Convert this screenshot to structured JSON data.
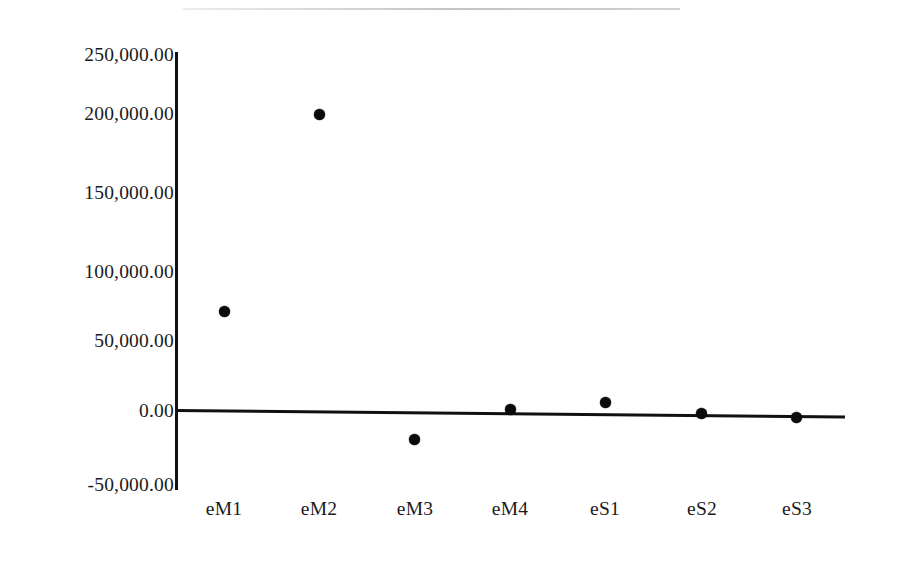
{
  "chart_data": {
    "type": "scatter",
    "title": "",
    "subtitle": "",
    "xlabel": "",
    "ylabel": "",
    "categories": [
      "eM1",
      "eM2",
      "eM3",
      "eM4",
      "eS1",
      "eS2",
      "eS3"
    ],
    "values": [
      70200.0,
      208500.0,
      -19700.0,
      1400.0,
      6300.0,
      -2100.0,
      -4900.0
    ],
    "series": [
      {
        "name": "",
        "values": [
          70200.0,
          208500.0,
          -19700.0,
          1400.0,
          6300.0,
          -2100.0,
          -4900.0
        ]
      }
    ],
    "ylim": [
      -50000,
      250000
    ],
    "ytick_values": [
      250000,
      200000,
      150000,
      100000,
      50000,
      0,
      -50000
    ],
    "ytick_labels": [
      "250,000.00",
      "200,000.00",
      "150,000.00",
      "100,000.00",
      "50,000.00",
      "0.00",
      "-50,000.00"
    ],
    "grid": false,
    "legend": false,
    "legend_position": "none",
    "marker_style": "filled-circle",
    "marker_color": "#0b0b0b",
    "axis_color": "#111111",
    "background_color": "#ffffff"
  },
  "axes": {
    "y": {
      "ticks": [
        {
          "label": "250,000.00",
          "value": 250000
        },
        {
          "label": "200,000.00",
          "value": 200000
        },
        {
          "label": "150,000.00",
          "value": 150000
        },
        {
          "label": "100,000.00",
          "value": 100000
        },
        {
          "label": "50,000.00",
          "value": 50000
        },
        {
          "label": "0.00",
          "value": 0
        },
        {
          "label": "-50,000.00",
          "value": -50000
        }
      ]
    },
    "x": {
      "ticks": [
        {
          "label": "eM1"
        },
        {
          "label": "eM2"
        },
        {
          "label": "eM3"
        },
        {
          "label": "eM4"
        },
        {
          "label": "eS1"
        },
        {
          "label": "eS2"
        },
        {
          "label": "eS3"
        }
      ]
    }
  }
}
